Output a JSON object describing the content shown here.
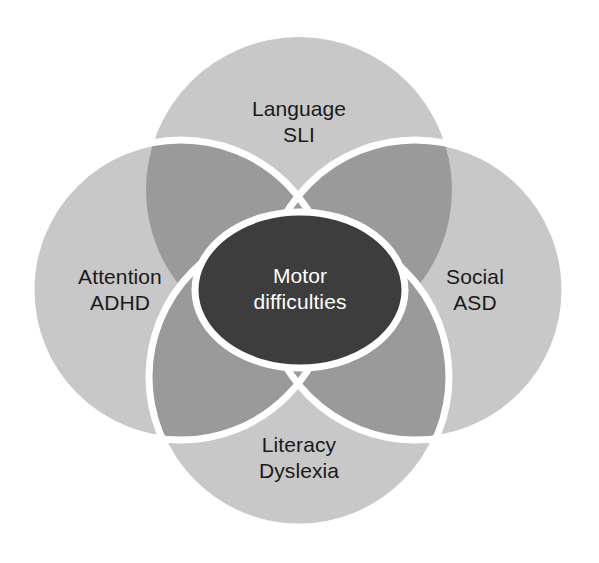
{
  "diagram": {
    "type": "venn",
    "background_color": "#ffffff",
    "circle_fill": "#c8c8c8",
    "overlap_fill": "#9a9a9a",
    "center_fill": "#3d3d3d",
    "outline_color": "#ffffff",
    "label_color": "#1a1a1a",
    "center_label_color": "#ffffff"
  },
  "sets": {
    "top": {
      "name": "language",
      "line1": "Language",
      "line2": "SLI",
      "cx": 299,
      "cy": 190,
      "r": 153
    },
    "left": {
      "name": "attention",
      "line1": "Attention",
      "line2": "ADHD",
      "cx": 181,
      "cy": 290,
      "r": 153
    },
    "right": {
      "name": "social",
      "line1": "Social",
      "line2": "ASD",
      "cx": 415,
      "cy": 290,
      "r": 153
    },
    "bottom": {
      "name": "literacy",
      "line1": "Literacy",
      "line2": "Dyslexia",
      "cx": 299,
      "cy": 377,
      "r": 153
    }
  },
  "center": {
    "name": "motor-difficulties",
    "line1": "Motor",
    "line2": "difficulties",
    "cx": 300,
    "cy": 290,
    "rx": 105,
    "ry": 78,
    "stroke_width": 7
  }
}
